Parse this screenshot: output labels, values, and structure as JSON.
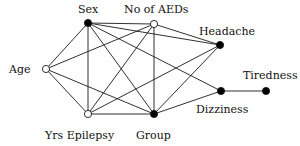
{
  "diagram": {
    "type": "undirected graphical model",
    "nodes": [
      {
        "id": "sex",
        "label": "Sex",
        "x": 88,
        "y": 23,
        "filled": true,
        "label_x": 78,
        "label_y": 4
      },
      {
        "id": "aeds",
        "label": "No of AEDs",
        "x": 154,
        "y": 24,
        "filled": false,
        "label_x": 124,
        "label_y": 4
      },
      {
        "id": "headache",
        "label": "Headache",
        "x": 220,
        "y": 45,
        "filled": true,
        "label_x": 199,
        "label_y": 26
      },
      {
        "id": "age",
        "label": "Age",
        "x": 46,
        "y": 69,
        "filled": false,
        "label_x": 9,
        "label_y": 64
      },
      {
        "id": "yrs",
        "label": "Yrs Epilepsy",
        "x": 88,
        "y": 114,
        "filled": false,
        "label_x": 45,
        "label_y": 130
      },
      {
        "id": "group",
        "label": "Group",
        "x": 154,
        "y": 114,
        "filled": true,
        "label_x": 136,
        "label_y": 130
      },
      {
        "id": "dizziness",
        "label": "Dizziness",
        "x": 221,
        "y": 91,
        "filled": true,
        "label_x": 196,
        "label_y": 104
      },
      {
        "id": "tiredness",
        "label": "Tiredness",
        "x": 266,
        "y": 91,
        "filled": true,
        "label_x": 243,
        "label_y": 70
      }
    ],
    "edges": [
      [
        "sex",
        "aeds"
      ],
      [
        "sex",
        "yrs"
      ],
      [
        "sex",
        "group"
      ],
      [
        "sex",
        "headache"
      ],
      [
        "sex",
        "dizziness"
      ],
      [
        "sex",
        "age"
      ],
      [
        "aeds",
        "age"
      ],
      [
        "aeds",
        "yrs"
      ],
      [
        "aeds",
        "group"
      ],
      [
        "aeds",
        "headache"
      ],
      [
        "age",
        "yrs"
      ],
      [
        "age",
        "group"
      ],
      [
        "yrs",
        "group"
      ],
      [
        "yrs",
        "headache"
      ],
      [
        "group",
        "headache"
      ],
      [
        "group",
        "dizziness"
      ],
      [
        "dizziness",
        "tiredness"
      ]
    ],
    "colors": {
      "line": "#1a1a1a",
      "node_fill": "#000000",
      "open_fill": "#ffffff"
    }
  }
}
